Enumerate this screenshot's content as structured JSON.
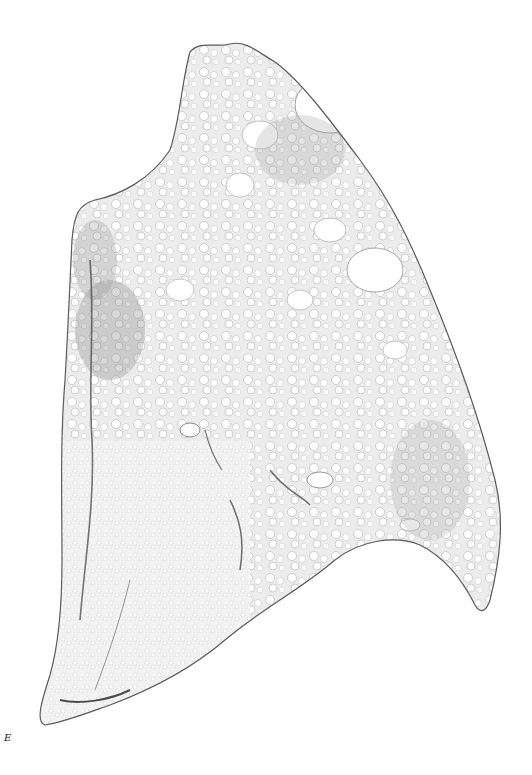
{
  "figure": {
    "panel_label": "E",
    "colors": {
      "background": "#ffffff",
      "tissue_fill": "#eeeeee",
      "tissue_edge": "#444444",
      "dense_region": "#9a9a9a",
      "airspace": "#ffffff"
    }
  }
}
